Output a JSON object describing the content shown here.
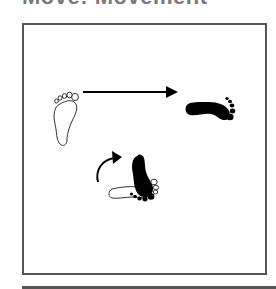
{
  "title": "Move: Movement",
  "diagram": {
    "panels": [
      {
        "name": "step-forward",
        "elements": [
          "outlined-foot-up",
          "straight-arrow-right",
          "filled-foot-right"
        ]
      },
      {
        "name": "pivot-turn",
        "elements": [
          "curved-arrow-clockwise",
          "filled-foot-up",
          "outlined-foot-right"
        ]
      }
    ],
    "colors": {
      "frame": "#555555",
      "ink": "#000000",
      "background": "#ffffff",
      "title": "#7a7a7a"
    }
  }
}
